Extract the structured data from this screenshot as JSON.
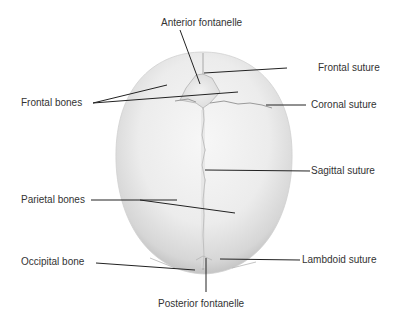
{
  "diagram": {
    "labels": {
      "anterior_fontanelle": "Anterior fontanelle",
      "frontal_suture": "Frontal  suture",
      "frontal_bones": "Frontal bones",
      "coronal_suture": "Coronal suture",
      "sagittal_suture": "Sagittal  suture",
      "parietal_bones": "Parietal bones",
      "occipital_bone": "Occipital bone",
      "lambdoid_suture": "Lambdoid suture",
      "posterior_fontanelle": "Posterior fontanelle"
    },
    "colors": {
      "bone_light": "#f4f4f4",
      "bone_shadow": "#c9c9c9",
      "suture_line": "#8a8a8a",
      "leader_line": "#222222",
      "text": "#333333"
    }
  }
}
